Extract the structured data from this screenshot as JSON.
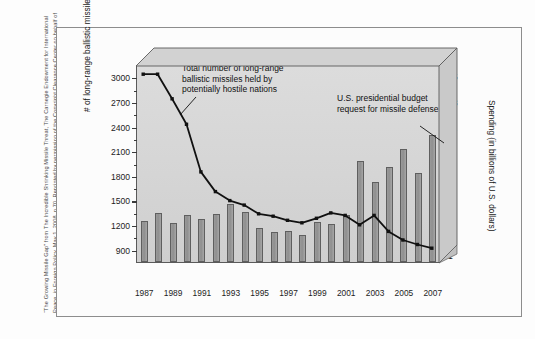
{
  "figure": {
    "credit": "“The Growing Missile Gap” from The Incredible Shrinking Missile Threat, The Carnegie Endowment for International Peace, in Foreign Policy, May 1, 2008, p.70. Reprinted by permission of the Copyright Clearance Center on behalf of the publisher."
  },
  "annotations": {
    "line_series": "Total number of long-range\nballistic missiles held by\npotentially hostile nations",
    "bar_series": "U.S. presidential budget\nrequest for missile defense"
  },
  "chart_data": {
    "type": "bar",
    "title": "",
    "xlabel": "",
    "ylabel": "# of long-range ballistic missiles",
    "y2label": "Spending (in billions of U.S. dollars)",
    "grid": false,
    "legend_position": "annotations",
    "x": [
      1987,
      1988,
      1989,
      1990,
      1991,
      1992,
      1993,
      1994,
      1995,
      1996,
      1997,
      1998,
      1999,
      2000,
      2001,
      2002,
      2003,
      2004,
      2005,
      2006,
      2007
    ],
    "categories": [
      "1987",
      "1988",
      "1989",
      "1990",
      "1991",
      "1992",
      "1993",
      "1994",
      "1995",
      "1996",
      "1997",
      "1998",
      "1999",
      "2000",
      "2001",
      "2002",
      "2003",
      "2004",
      "2005",
      "2006",
      "2007"
    ],
    "xtick_labels": [
      "1987",
      "1989",
      "1991",
      "1993",
      "1995",
      "1997",
      "1999",
      "2001",
      "2003",
      "2005",
      "2007"
    ],
    "ylim": [
      750,
      3150
    ],
    "yticks": [
      900,
      1200,
      1500,
      1800,
      2100,
      2400,
      2700,
      3000
    ],
    "ytick_labels": [
      "900",
      "1200",
      "1500",
      "1800",
      "2100",
      "2400",
      "2700",
      "3000"
    ],
    "y2lim": [
      0.45,
      15.9
    ],
    "y2ticks": [
      1,
      3,
      5,
      7,
      9,
      11,
      13,
      15
    ],
    "y2tick_labels": [
      "1",
      "3",
      "5",
      "7",
      "9",
      "11",
      "13",
      "15"
    ],
    "y2minor_ticks": [
      2,
      4,
      6,
      8,
      10,
      12,
      14
    ],
    "series": [
      {
        "name": "U.S. presidential budget request for missile defense",
        "type": "bar",
        "axis": "right",
        "unit": "billions of U.S. dollars",
        "color": "#969696",
        "values": [
          3.7,
          4.3,
          3.5,
          4.1,
          3.8,
          4.2,
          5.0,
          4.4,
          3.1,
          2.8,
          2.9,
          2.6,
          3.6,
          3.4,
          4.1,
          8.4,
          6.7,
          7.9,
          9.3,
          7.4,
          10.4
        ]
      },
      {
        "name": "Total number of long-range ballistic missiles held by potentially hostile nations",
        "type": "line",
        "axis": "left",
        "unit": "missiles",
        "color": "#111111",
        "marker": "square",
        "values": [
          3050,
          3050,
          2750,
          2440,
          1860,
          1620,
          1510,
          1455,
          1350,
          1320,
          1270,
          1240,
          1295,
          1360,
          1330,
          1215,
          1330,
          1135,
          1030,
          975,
          930
        ]
      }
    ]
  }
}
